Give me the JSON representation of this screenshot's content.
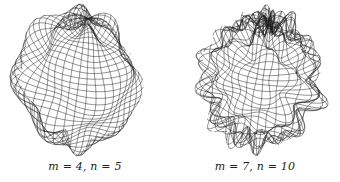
{
  "figure": {
    "panels": [
      {
        "caption": "m = 4, n = 5",
        "params": {
          "m": 4,
          "n": 5
        },
        "center": [
          78,
          80
        ],
        "radius": 62,
        "amplitude": 0.13,
        "rings": 34,
        "meridians": 40
      },
      {
        "caption": "m = 7, n = 10",
        "params": {
          "m": 7,
          "n": 10
        },
        "center": [
          91,
          80
        ],
        "radius": 60,
        "amplitude": 0.16,
        "rings": 36,
        "meridians": 44
      }
    ],
    "line_color": "#1a1a1a",
    "background": "#ffffff"
  }
}
